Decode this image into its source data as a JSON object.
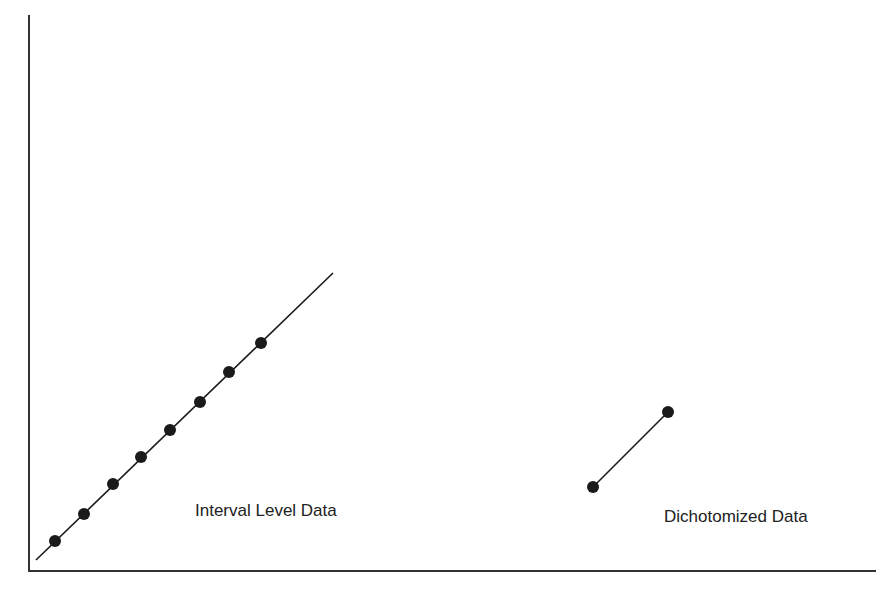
{
  "chart_data": {
    "type": "scatter",
    "title": "",
    "xlabel": "",
    "ylabel": "",
    "grid": false,
    "axes": {
      "origin_px": [
        29,
        571
      ],
      "x_end_px": 876,
      "y_top_px": 15
    },
    "series": [
      {
        "name": "Interval Level Data",
        "label": "Interval Level Data",
        "points_px": [
          [
            55,
            541
          ],
          [
            84,
            514
          ],
          [
            113,
            484
          ],
          [
            141,
            457
          ],
          [
            170,
            430
          ],
          [
            200,
            402
          ],
          [
            229,
            372
          ],
          [
            261,
            343
          ]
        ],
        "fit_line_px": [
          [
            36,
            560
          ],
          [
            333,
            273
          ]
        ]
      },
      {
        "name": "Dichotomized Data",
        "label": "Dichotomized Data",
        "points_px": [
          [
            593,
            487
          ],
          [
            668,
            412
          ]
        ],
        "fit_line_px": [
          [
            593,
            487
          ],
          [
            668,
            412
          ]
        ]
      }
    ]
  },
  "labels": {
    "interval": "Interval Level Data",
    "dichotomized": "Dichotomized Data"
  },
  "colors": {
    "ink": "#1a1a1a",
    "background": "#ffffff"
  }
}
